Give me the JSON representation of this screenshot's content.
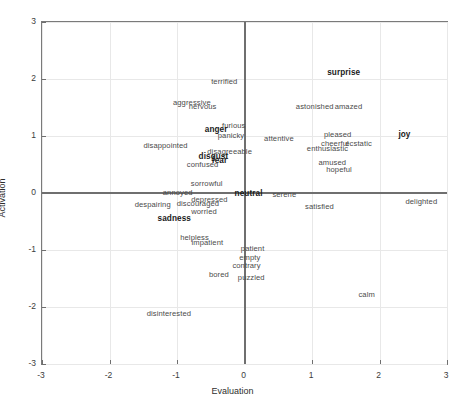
{
  "chart_data": {
    "type": "scatter",
    "title": "",
    "xlabel": "Evaluation",
    "ylabel": "Activation",
    "xlim": [
      -3,
      3
    ],
    "ylim": [
      -3,
      3
    ],
    "xticks": [
      "-3",
      "-2",
      "-1",
      "0",
      "1",
      "2",
      "3"
    ],
    "yticks": [
      "-3",
      "-2",
      "-1",
      "0",
      "1",
      "2",
      "3"
    ],
    "grid": true,
    "legend": "none",
    "marker": "text-label",
    "points": [
      {
        "label": "terrified",
        "x": -0.3,
        "y": 1.96,
        "bold": false
      },
      {
        "label": "aggressive",
        "x": -0.78,
        "y": 1.6,
        "bold": false
      },
      {
        "label": "nervous",
        "x": -0.62,
        "y": 1.52,
        "bold": false
      },
      {
        "label": "surprise",
        "x": 1.47,
        "y": 2.13,
        "bold": true
      },
      {
        "label": "astonished",
        "x": 1.04,
        "y": 1.53,
        "bold": false
      },
      {
        "label": "amazed",
        "x": 1.54,
        "y": 1.53,
        "bold": false
      },
      {
        "label": "furious",
        "x": -0.16,
        "y": 1.19,
        "bold": false
      },
      {
        "label": "anger",
        "x": -0.42,
        "y": 1.12,
        "bold": true
      },
      {
        "label": "panicky",
        "x": -0.2,
        "y": 1.02,
        "bold": false
      },
      {
        "label": "attentive",
        "x": 0.51,
        "y": 0.97,
        "bold": false
      },
      {
        "label": "pleased",
        "x": 1.38,
        "y": 1.03,
        "bold": false
      },
      {
        "label": "joy",
        "x": 2.37,
        "y": 1.03,
        "bold": true
      },
      {
        "label": "cheerful",
        "x": 1.34,
        "y": 0.88,
        "bold": false
      },
      {
        "label": "ecstatic",
        "x": 1.69,
        "y": 0.88,
        "bold": false
      },
      {
        "label": "disappointed",
        "x": -1.17,
        "y": 0.85,
        "bold": false
      },
      {
        "label": "enthusiastic",
        "x": 1.23,
        "y": 0.79,
        "bold": false
      },
      {
        "label": "disagreeable",
        "x": -0.22,
        "y": 0.74,
        "bold": false
      },
      {
        "label": "disgust",
        "x": -0.46,
        "y": 0.65,
        "bold": true
      },
      {
        "label": "fear",
        "x": -0.37,
        "y": 0.58,
        "bold": true
      },
      {
        "label": "amused",
        "x": 1.3,
        "y": 0.55,
        "bold": false
      },
      {
        "label": "confused",
        "x": -0.62,
        "y": 0.51,
        "bold": false
      },
      {
        "label": "hopeful",
        "x": 1.4,
        "y": 0.42,
        "bold": false
      },
      {
        "label": "sorrowful",
        "x": -0.56,
        "y": 0.17,
        "bold": false
      },
      {
        "label": "annoyed",
        "x": -0.99,
        "y": 0.02,
        "bold": false
      },
      {
        "label": "neutral",
        "x": 0.06,
        "y": 0.0,
        "bold": true
      },
      {
        "label": "serene",
        "x": 0.59,
        "y": -0.02,
        "bold": false
      },
      {
        "label": "depressed",
        "x": -0.52,
        "y": -0.11,
        "bold": false
      },
      {
        "label": "delighted",
        "x": 2.62,
        "y": -0.14,
        "bold": false
      },
      {
        "label": "discouraged",
        "x": -0.69,
        "y": -0.17,
        "bold": false
      },
      {
        "label": "despairing",
        "x": -1.36,
        "y": -0.19,
        "bold": false
      },
      {
        "label": "satisfied",
        "x": 1.11,
        "y": -0.22,
        "bold": false
      },
      {
        "label": "worried",
        "x": -0.6,
        "y": -0.32,
        "bold": false
      },
      {
        "label": "sadness",
        "x": -1.04,
        "y": -0.44,
        "bold": true
      },
      {
        "label": "helpless",
        "x": -0.74,
        "y": -0.77,
        "bold": false
      },
      {
        "label": "impatient",
        "x": -0.55,
        "y": -0.86,
        "bold": false
      },
      {
        "label": "patient",
        "x": 0.12,
        "y": -0.97,
        "bold": false
      },
      {
        "label": "empty",
        "x": 0.08,
        "y": -1.12,
        "bold": false
      },
      {
        "label": "contrary",
        "x": 0.03,
        "y": -1.26,
        "bold": false
      },
      {
        "label": "bored",
        "x": -0.38,
        "y": -1.42,
        "bold": false
      },
      {
        "label": "puzzled",
        "x": 0.1,
        "y": -1.48,
        "bold": false
      },
      {
        "label": "calm",
        "x": 1.81,
        "y": -1.78,
        "bold": false
      },
      {
        "label": "disinterested",
        "x": -1.12,
        "y": -2.1,
        "bold": false
      }
    ]
  }
}
